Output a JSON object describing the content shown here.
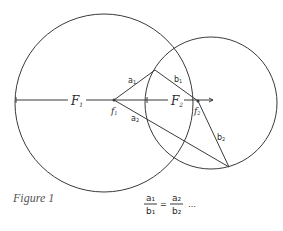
{
  "figure": {
    "caption": "Figure 1",
    "labels": {
      "F1": "F",
      "F1_sub": "1",
      "F2": "F",
      "F2_sub": "2",
      "f1": "f",
      "f1_sub": "1",
      "f2": "f",
      "f2_sub": "2",
      "a1": "a",
      "a1_sub": "1",
      "a2": "a",
      "a2_sub": "2",
      "b1": "b",
      "b1_sub": "1",
      "b2": "b",
      "b2_sub": "2"
    },
    "equation": {
      "num1": "a₁",
      "den1": "b₁",
      "equals": "=",
      "num2": "a₂",
      "den2": "b₂",
      "ellipsis": "…"
    },
    "colors": {
      "stroke": "#3a3a3a",
      "text": "#2a2a2a",
      "caption": "#555555"
    }
  }
}
